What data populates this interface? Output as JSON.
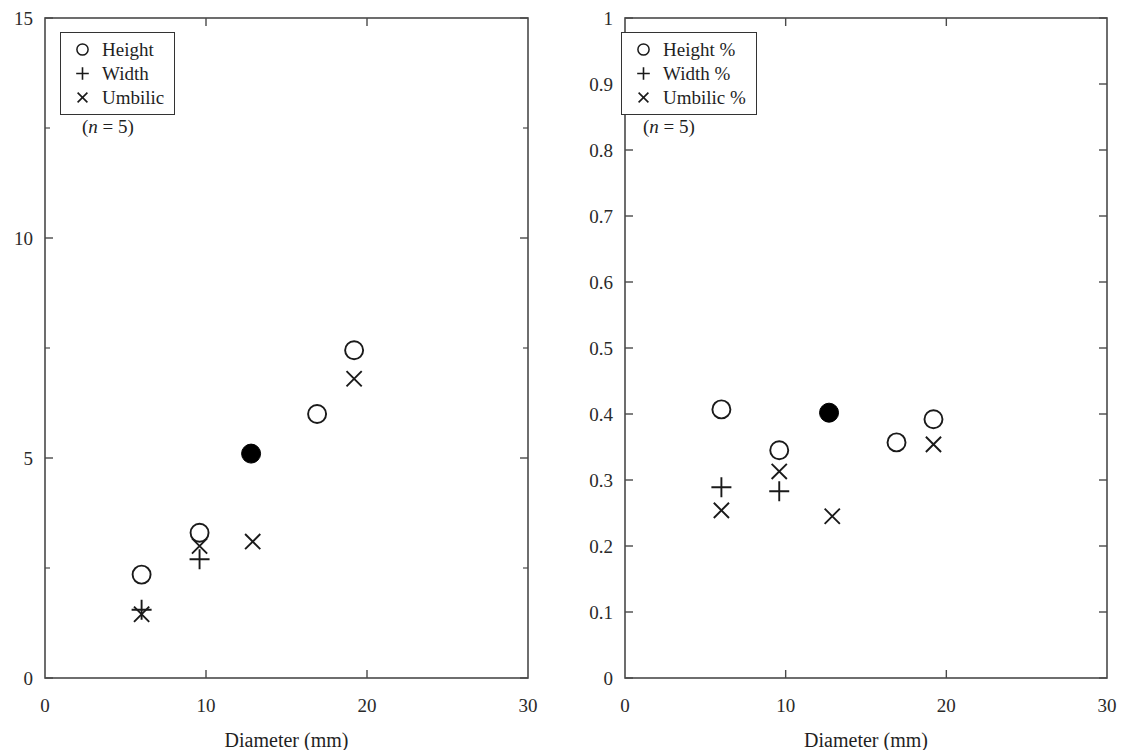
{
  "figure": {
    "panels": [
      {
        "id": "left",
        "axis": {
          "xlabel": "Diameter (mm)",
          "ylabel": "",
          "xlim": [
            0,
            30
          ],
          "ylim": [
            0,
            15
          ],
          "xticks": [
            0,
            10,
            20,
            30
          ],
          "xtick_labels": [
            "0",
            "10",
            "20",
            "30"
          ],
          "yticks": [
            0,
            5,
            10,
            15
          ],
          "ytick_labels": [
            "0",
            "5",
            "10",
            "15"
          ],
          "yminor_ticks": [
            2.5,
            7.5,
            12.5
          ]
        },
        "legend": {
          "items": [
            {
              "marker": "circle",
              "label": "Height"
            },
            {
              "marker": "plus",
              "label": "Width"
            },
            {
              "marker": "cross",
              "label": "Umbilic"
            }
          ],
          "note_prefix": "(",
          "note_italic": "n",
          "note_suffix": " = 5)"
        }
      },
      {
        "id": "right",
        "axis": {
          "xlabel": "Diameter (mm)",
          "ylabel": "",
          "xlim": [
            0,
            30
          ],
          "ylim": [
            0,
            1
          ],
          "xticks": [
            0,
            10,
            20,
            30
          ],
          "xtick_labels": [
            "0",
            "10",
            "20",
            "30"
          ],
          "yticks": [
            0,
            0.1,
            0.2,
            0.3,
            0.4,
            0.5,
            0.6,
            0.7,
            0.8,
            0.9,
            1
          ],
          "ytick_labels": [
            "0",
            "0.1",
            "0.2",
            "0.3",
            "0.4",
            "0.5",
            "0.6",
            "0.7",
            "0.8",
            "0.9",
            "1"
          ],
          "yminor_ticks": []
        },
        "legend": {
          "items": [
            {
              "marker": "circle",
              "label": "Height %"
            },
            {
              "marker": "plus",
              "label": "Width %"
            },
            {
              "marker": "cross",
              "label": "Umbilic %"
            }
          ],
          "note_prefix": "(",
          "note_italic": "n",
          "note_suffix": " = 5)"
        }
      }
    ]
  },
  "chart_data": [
    {
      "type": "scatter",
      "panel": "left",
      "title": "",
      "xlabel": "Diameter (mm)",
      "ylabel": "",
      "xlim": [
        0,
        30
      ],
      "ylim": [
        0,
        15
      ],
      "grid": false,
      "legend_position": "top-left",
      "sample_size": 5,
      "series": [
        {
          "name": "Height",
          "marker": "circle",
          "points": [
            {
              "x": 6.0,
              "y": 2.35
            },
            {
              "x": 9.6,
              "y": 3.3
            },
            {
              "x": 16.9,
              "y": 6.0
            },
            {
              "x": 19.2,
              "y": 7.45
            }
          ]
        },
        {
          "name": "Width",
          "marker": "plus",
          "points": [
            {
              "x": 6.0,
              "y": 1.55
            },
            {
              "x": 9.6,
              "y": 2.7
            }
          ]
        },
        {
          "name": "Umbilic",
          "marker": "cross",
          "points": [
            {
              "x": 6.0,
              "y": 1.45
            },
            {
              "x": 9.6,
              "y": 3.0
            },
            {
              "x": 12.9,
              "y": 3.1
            },
            {
              "x": 19.2,
              "y": 6.8
            }
          ]
        },
        {
          "name": "Filled marker",
          "marker": "filled-circle",
          "points": [
            {
              "x": 12.8,
              "y": 5.1
            }
          ]
        }
      ]
    },
    {
      "type": "scatter",
      "panel": "right",
      "title": "",
      "xlabel": "Diameter (mm)",
      "ylabel": "",
      "xlim": [
        0,
        30
      ],
      "ylim": [
        0,
        1
      ],
      "grid": false,
      "legend_position": "top-left",
      "sample_size": 5,
      "series": [
        {
          "name": "Height %",
          "marker": "circle",
          "points": [
            {
              "x": 6.0,
              "y": 0.407
            },
            {
              "x": 9.6,
              "y": 0.345
            },
            {
              "x": 16.9,
              "y": 0.357
            },
            {
              "x": 19.2,
              "y": 0.392
            }
          ]
        },
        {
          "name": "Width %",
          "marker": "plus",
          "points": [
            {
              "x": 6.0,
              "y": 0.289
            },
            {
              "x": 9.6,
              "y": 0.283
            }
          ]
        },
        {
          "name": "Umbilic %",
          "marker": "cross",
          "points": [
            {
              "x": 6.0,
              "y": 0.254
            },
            {
              "x": 9.6,
              "y": 0.313
            },
            {
              "x": 12.9,
              "y": 0.245
            },
            {
              "x": 19.2,
              "y": 0.354
            }
          ]
        },
        {
          "name": "Filled marker",
          "marker": "filled-circle",
          "points": [
            {
              "x": 12.7,
              "y": 0.402
            }
          ]
        }
      ]
    }
  ]
}
